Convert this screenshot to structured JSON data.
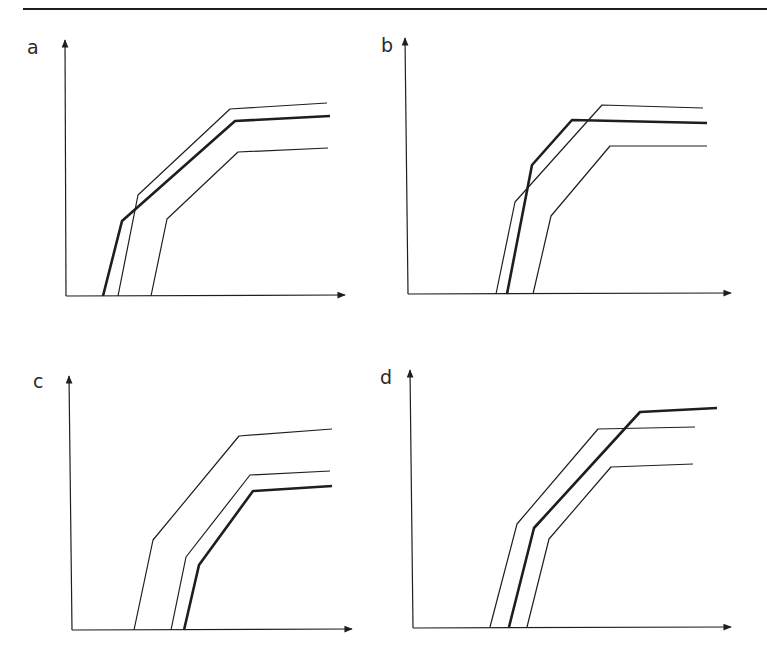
{
  "figure": {
    "line_color": "#1e1e1e",
    "background": "#ffffff",
    "top_rule": true
  },
  "chart_data": [
    {
      "type": "line",
      "panel": "a",
      "title": "a",
      "xlabel": "",
      "ylabel": "",
      "grid": false,
      "axes": {
        "x_ticks": [],
        "y_ticks": [],
        "arrows": true
      },
      "series": [
        {
          "name": "thin-upper",
          "weight": "thin",
          "points": [
            [
              118,
              296
            ],
            [
              138,
              195
            ],
            [
              230,
              109
            ],
            [
              327,
              103
            ]
          ]
        },
        {
          "name": "thick",
          "weight": "thick",
          "points": [
            [
              103,
              296
            ],
            [
              122,
              221
            ],
            [
              235,
              121
            ],
            [
              330,
              116
            ]
          ]
        },
        {
          "name": "thin-lower",
          "weight": "thin",
          "points": [
            [
              151,
              296
            ],
            [
              167,
              219
            ],
            [
              238,
              152
            ],
            [
              328,
              148
            ]
          ]
        }
      ]
    },
    {
      "type": "line",
      "panel": "b",
      "title": "b",
      "xlabel": "",
      "ylabel": "",
      "grid": false,
      "axes": {
        "x_ticks": [],
        "y_ticks": [],
        "arrows": true
      },
      "series": [
        {
          "name": "thin-upper",
          "weight": "thin",
          "points": [
            [
              496,
              294
            ],
            [
              515,
              202
            ],
            [
              602,
              105
            ],
            [
              703,
              108
            ]
          ]
        },
        {
          "name": "thick",
          "weight": "thick",
          "points": [
            [
              507,
              294
            ],
            [
              532,
              165
            ],
            [
              572,
              120
            ],
            [
              707,
              123
            ]
          ]
        },
        {
          "name": "thin-lower",
          "weight": "thin",
          "points": [
            [
              533,
              294
            ],
            [
              551,
              216
            ],
            [
              610,
              146
            ],
            [
              707,
              146
            ]
          ]
        }
      ]
    },
    {
      "type": "line",
      "panel": "c",
      "title": "c",
      "xlabel": "",
      "ylabel": "",
      "grid": false,
      "axes": {
        "x_ticks": [],
        "y_ticks": [],
        "arrows": true
      },
      "series": [
        {
          "name": "thin-upper",
          "weight": "thin",
          "points": [
            [
              134,
              630
            ],
            [
              153,
              540
            ],
            [
              239,
              436
            ],
            [
              332,
              429
            ]
          ]
        },
        {
          "name": "thin-middle",
          "weight": "thin",
          "points": [
            [
              171,
              630
            ],
            [
              186,
              557
            ],
            [
              250,
              475
            ],
            [
              330,
              471
            ]
          ]
        },
        {
          "name": "thick",
          "weight": "thick",
          "points": [
            [
              184,
              630
            ],
            [
              199,
              565
            ],
            [
              253,
              491
            ],
            [
              332,
              486
            ]
          ]
        }
      ]
    },
    {
      "type": "line",
      "panel": "d",
      "title": "d",
      "xlabel": "",
      "ylabel": "",
      "grid": false,
      "axes": {
        "x_ticks": [],
        "y_ticks": [],
        "arrows": true
      },
      "series": [
        {
          "name": "thin-upper",
          "weight": "thin",
          "points": [
            [
              490,
              627
            ],
            [
              517,
              524
            ],
            [
              598,
              429
            ],
            [
              695,
              427
            ]
          ]
        },
        {
          "name": "thick",
          "weight": "thick",
          "points": [
            [
              509,
              627
            ],
            [
              534,
              528
            ],
            [
              640,
              412
            ],
            [
              717,
              408
            ]
          ]
        },
        {
          "name": "thin-lower",
          "weight": "thin",
          "points": [
            [
              527,
              627
            ],
            [
              549,
              539
            ],
            [
              611,
              467
            ],
            [
              693,
              464
            ]
          ]
        }
      ]
    }
  ],
  "panels": {
    "a": {
      "label": "a"
    },
    "b": {
      "label": "b"
    },
    "c": {
      "label": "c"
    },
    "d": {
      "label": "d"
    }
  }
}
